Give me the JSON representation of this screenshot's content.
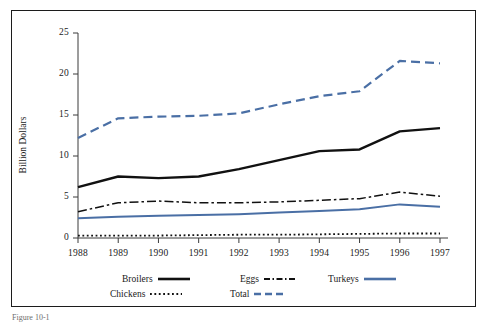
{
  "figure": {
    "caption_fragment": "Figure 10-1"
  },
  "axes": {
    "ylabel": "Billion Dollars",
    "y_ticks": [
      "0",
      "5",
      "10",
      "15",
      "20",
      "25"
    ],
    "x_ticks": [
      "1988",
      "1989",
      "1990",
      "1991",
      "1992",
      "1993",
      "1994",
      "1995",
      "1996",
      "1997"
    ]
  },
  "legend": {
    "row1": [
      {
        "label": "Broilers",
        "style": "solid-black",
        "color": "#111111"
      },
      {
        "label": "Eggs",
        "style": "dashdot-black",
        "color": "#111111"
      },
      {
        "label": "Turkeys",
        "style": "solid-blue",
        "color": "#4a6fa5"
      }
    ],
    "row2": [
      {
        "label": "Chickens",
        "style": "dotted-black",
        "color": "#111111"
      },
      {
        "label": "Total",
        "style": "dashed-blue",
        "color": "#4a6fa5"
      }
    ]
  },
  "colors": {
    "black": "#111111",
    "blue": "#4a6fa5",
    "axis": "#3a3a3a",
    "frame": "#1c1c1c"
  },
  "chart_data": {
    "type": "line",
    "title": "",
    "xlabel": "",
    "ylabel": "Billion Dollars",
    "x": [
      1988,
      1989,
      1990,
      1991,
      1992,
      1993,
      1994,
      1995,
      1996,
      1997
    ],
    "ylim": [
      0,
      25
    ],
    "xlim": [
      1988,
      1997
    ],
    "y_ticks": [
      0,
      5,
      10,
      15,
      20,
      25
    ],
    "grid": false,
    "legend_position": "below-axes",
    "series": [
      {
        "name": "Total",
        "color": "#4a6fa5",
        "style": "dashed",
        "values": [
          12.2,
          14.6,
          14.8,
          14.9,
          15.2,
          16.3,
          17.3,
          17.9,
          21.6,
          21.3
        ]
      },
      {
        "name": "Broilers",
        "color": "#111111",
        "style": "solid",
        "values": [
          6.2,
          7.5,
          7.3,
          7.5,
          8.4,
          9.5,
          10.6,
          10.8,
          13.0,
          13.4
        ]
      },
      {
        "name": "Eggs",
        "color": "#111111",
        "style": "dashdot",
        "values": [
          3.2,
          4.3,
          4.5,
          4.3,
          4.3,
          4.4,
          4.6,
          4.8,
          5.6,
          5.1
        ]
      },
      {
        "name": "Turkeys",
        "color": "#4a6fa5",
        "style": "solid",
        "values": [
          2.4,
          2.6,
          2.7,
          2.8,
          2.9,
          3.1,
          3.3,
          3.5,
          4.1,
          3.8
        ]
      },
      {
        "name": "Chickens",
        "color": "#111111",
        "style": "dotted",
        "values": [
          0.3,
          0.3,
          0.3,
          0.35,
          0.4,
          0.4,
          0.45,
          0.5,
          0.55,
          0.55
        ]
      }
    ]
  }
}
